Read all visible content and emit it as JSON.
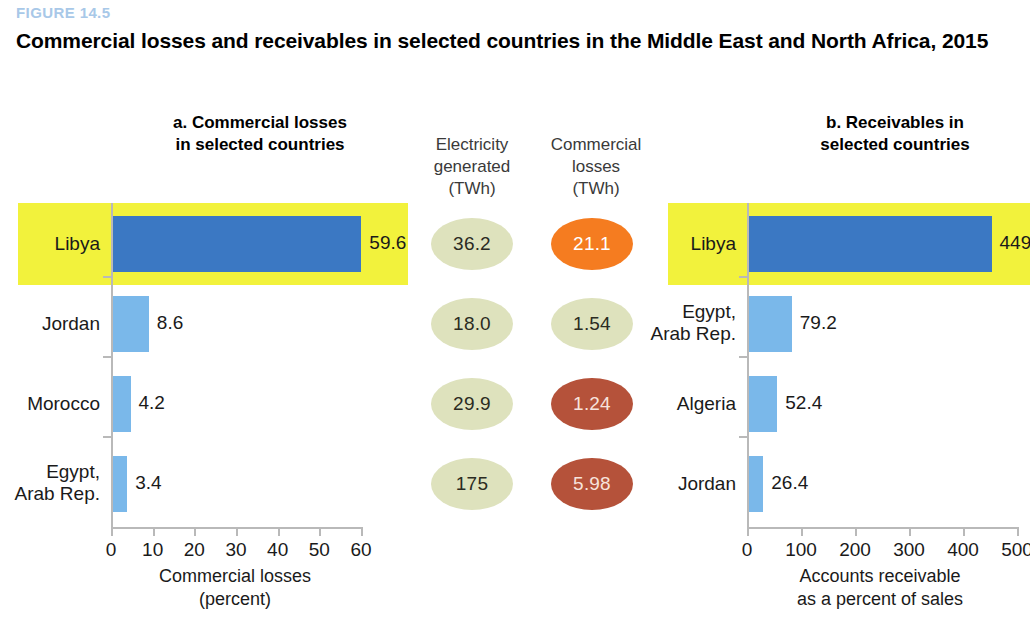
{
  "figure": {
    "number": "FIGURE 14.5",
    "title": "Commercial losses and receivables in selected countries in the Middle East and North Africa, 2015",
    "number_color": "#a8c8e8"
  },
  "panel_a": {
    "title": "a. Commercial losses\nin selected countries",
    "axis_caption": "Commercial losses\n(percent)"
  },
  "panel_b": {
    "title": "b. Receivables in\nselected countries",
    "axis_caption": "Accounts receivable\nas a percent of sales"
  },
  "center": {
    "generated_header": "Electricity\ngenerated\n(TWh)",
    "losses_header": "Commercial\nlosses\n(TWh)"
  },
  "colors": {
    "highlight": "#f2f23c",
    "bar_dark": "#3b78c3",
    "bar_light": "#7ab8ea",
    "ellipse_olive": "#dee2bd",
    "ellipse_orange": "#f57c20",
    "ellipse_terracotta": "#b5523a"
  },
  "chart_data": [
    {
      "type": "bar",
      "id": "panel-a",
      "title": "a. Commercial losses in selected countries",
      "orientation": "horizontal",
      "categories": [
        "Libya",
        "Jordan",
        "Morocco",
        "Egypt,\nArab Rep."
      ],
      "values": [
        59.6,
        8.6,
        4.2,
        3.4
      ],
      "value_labels": [
        "59.6",
        "8.6",
        "4.2",
        "3.4"
      ],
      "bar_colors": [
        "#3b78c3",
        "#7ab8ea",
        "#7ab8ea",
        "#7ab8ea"
      ],
      "highlighted_category": "Libya",
      "xlabel": "Commercial losses (percent)",
      "ylabel": "",
      "xlim": [
        0,
        60
      ],
      "xticks": [
        0,
        10,
        20,
        30,
        40,
        50,
        60
      ],
      "xtick_labels": [
        "0",
        "10",
        "20",
        "30",
        "40",
        "50",
        "60"
      ],
      "grid": false,
      "legend": "none"
    },
    {
      "type": "bar",
      "id": "panel-b",
      "title": "b. Receivables in selected countries",
      "orientation": "horizontal",
      "categories": [
        "Libya",
        "Egypt,\nArab Rep.",
        "Algeria",
        "Jordan"
      ],
      "values": [
        449.1,
        79.2,
        52.4,
        26.4
      ],
      "value_labels": [
        "449.1",
        "79.2",
        "52.4",
        "26.4"
      ],
      "bar_colors": [
        "#3b78c3",
        "#7ab8ea",
        "#7ab8ea",
        "#7ab8ea"
      ],
      "highlighted_category": "Libya",
      "xlabel": "Accounts receivable as a percent of sales",
      "ylabel": "",
      "xlim": [
        0,
        500
      ],
      "xticks": [
        0,
        100,
        200,
        300,
        400,
        500
      ],
      "xtick_labels": [
        "0",
        "100",
        "200",
        "300",
        "400",
        "500"
      ],
      "grid": false,
      "legend": "none"
    },
    {
      "type": "table",
      "id": "center-columns",
      "title": "Electricity generated and commercial losses (TWh)",
      "columns": [
        "Electricity generated (TWh)",
        "Commercial losses (TWh)"
      ],
      "rows": [
        {
          "generated": "36.2",
          "losses": "21.1",
          "losses_color": "#f57c20"
        },
        {
          "generated": "18.0",
          "losses": "1.54",
          "losses_color": "#dee2bd"
        },
        {
          "generated": "29.9",
          "losses": "1.24",
          "losses_color": "#b5523a"
        },
        {
          "generated": "175",
          "losses": "5.98",
          "losses_color": "#b5523a"
        }
      ]
    }
  ]
}
